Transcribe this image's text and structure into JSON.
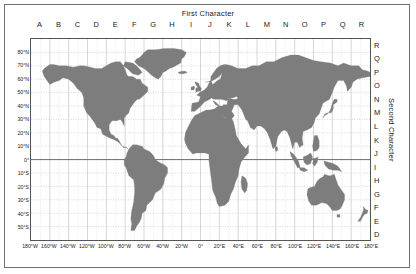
{
  "figure": {
    "top_title": "First Character",
    "right_title": "Second Character"
  },
  "chart_data": {
    "type": "map",
    "title": "First Character",
    "xlabel": "",
    "ylabel": "",
    "grid": true,
    "projection": "equirectangular",
    "xlim": [
      -180,
      180
    ],
    "ylim": [
      -60,
      90
    ],
    "land_color": "#7d7d7d",
    "ocean_color": "#ffffff",
    "grid_color": "#b9b9b9",
    "equator_color": "#5a5a5a",
    "first_character": {
      "label": "First Character",
      "values": [
        "A",
        "B",
        "C",
        "D",
        "E",
        "F",
        "G",
        "H",
        "I",
        "J",
        "K",
        "L",
        "M",
        "N",
        "O",
        "P",
        "Q",
        "R"
      ],
      "cell_width_degrees": 20,
      "start_longitude": -180
    },
    "second_character": {
      "label": "Second Character",
      "values": [
        "R",
        "Q",
        "P",
        "O",
        "N",
        "M",
        "L",
        "K",
        "J",
        "I",
        "H",
        "G",
        "F",
        "E",
        "D"
      ],
      "cell_height_degrees": 10,
      "top_latitude": 90
    },
    "longitude_ticks": [
      {
        "value": -180,
        "label": "180°W"
      },
      {
        "value": -160,
        "label": "160°W"
      },
      {
        "value": -140,
        "label": "140°W"
      },
      {
        "value": -120,
        "label": "120°W"
      },
      {
        "value": -100,
        "label": "100°W"
      },
      {
        "value": -80,
        "label": "80°W"
      },
      {
        "value": -60,
        "label": "60°W"
      },
      {
        "value": -40,
        "label": "40°W"
      },
      {
        "value": -20,
        "label": "20°W"
      },
      {
        "value": 0,
        "label": "0°"
      },
      {
        "value": 20,
        "label": "20°E"
      },
      {
        "value": 40,
        "label": "40°E"
      },
      {
        "value": 60,
        "label": "60°E"
      },
      {
        "value": 80,
        "label": "80°E"
      },
      {
        "value": 100,
        "label": "100°E"
      },
      {
        "value": 120,
        "label": "120°E"
      },
      {
        "value": 140,
        "label": "140°E"
      },
      {
        "value": 160,
        "label": "160°E"
      },
      {
        "value": 180,
        "label": "180°E"
      }
    ],
    "latitude_ticks": [
      {
        "value": 80,
        "label": "80°N"
      },
      {
        "value": 70,
        "label": "70°N"
      },
      {
        "value": 60,
        "label": "60°N"
      },
      {
        "value": 50,
        "label": "50°N"
      },
      {
        "value": 40,
        "label": "40°N"
      },
      {
        "value": 30,
        "label": "30°N"
      },
      {
        "value": 20,
        "label": "20°N"
      },
      {
        "value": 10,
        "label": "10°N"
      },
      {
        "value": 0,
        "label": "0°"
      },
      {
        "value": -10,
        "label": "10°S"
      },
      {
        "value": -20,
        "label": "20°S"
      },
      {
        "value": -30,
        "label": "30°S"
      },
      {
        "value": -40,
        "label": "40°S"
      },
      {
        "value": -50,
        "label": "50°S"
      }
    ]
  }
}
